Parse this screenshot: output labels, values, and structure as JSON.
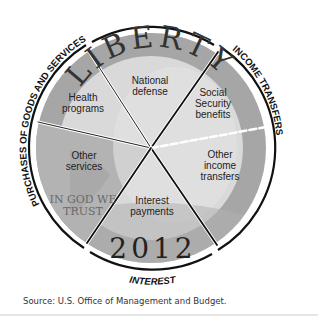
{
  "diagram": {
    "type": "pie-coin-diagram",
    "coin": {
      "top_inscription": "LIBERTY",
      "motto": [
        "IN GOD WE",
        "TRUST"
      ],
      "year": "2012"
    },
    "segments": [
      {
        "id": "health",
        "label": [
          "Health",
          "programs"
        ],
        "group": "Purchases of goods and services"
      },
      {
        "id": "defense",
        "label": [
          "National",
          "defense"
        ],
        "group": "Purchases of goods and services"
      },
      {
        "id": "social-security",
        "label": [
          "Social",
          "Security",
          "benefits"
        ],
        "group": "Income transfers"
      },
      {
        "id": "other-income",
        "label": [
          "Other",
          "income",
          "transfers"
        ],
        "group": "Income transfers"
      },
      {
        "id": "interest",
        "label": [
          "Interest",
          "payments"
        ],
        "group": "Interest"
      },
      {
        "id": "other-services",
        "label": [
          "Other",
          "services"
        ],
        "group": "Purchases of goods and services"
      }
    ],
    "outer_labels": {
      "goods": "PURCHASES OF GOODS AND SERVICES",
      "income": "INCOME TRANSFERS",
      "interest": "INTEREST"
    },
    "colors": {
      "ring_dark": "#a9a9a9",
      "face_light": "#d6d6d6",
      "face_lighter": "#e0e0e0",
      "line": "#111111"
    }
  },
  "footer": {
    "source": "Source: U.S. Office of Management and Budget."
  }
}
